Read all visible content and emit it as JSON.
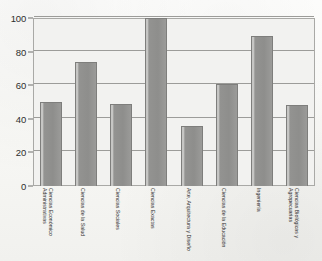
{
  "chart_data": {
    "type": "bar",
    "title": "",
    "subtitle": "",
    "xlabel": "",
    "ylabel": "",
    "ylim": [
      0,
      100
    ],
    "yticks": [
      0,
      20,
      40,
      60,
      80,
      100
    ],
    "grid": true,
    "legend": false,
    "categories": [
      "Ciencias Económico Administrativas",
      "Ciencias de la Salud",
      "Ciencias Sociales",
      "Ciencias Exactas",
      "Arte, Arquitectura y Diseño",
      "Ciencias de la Educación",
      "Ingeniería",
      "Ciencias Biológicas y Agropecuarias"
    ],
    "values": [
      50,
      74,
      49,
      100,
      36,
      61,
      89,
      48
    ]
  },
  "style": {
    "bar_fill": "#919191",
    "bar_edge": "#7e7e7c",
    "plot_background": "#f2f2f0",
    "page_background": "#fbfbf9",
    "gridline_color": "#9c9c99",
    "axis_text_color": "#2e2e2e"
  }
}
